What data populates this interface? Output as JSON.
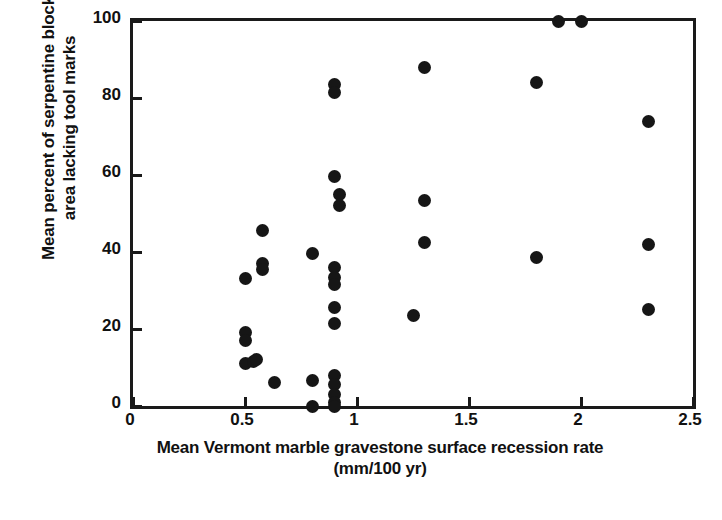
{
  "chart_data": {
    "type": "scatter",
    "title": "",
    "xlabel": "Mean Vermont marble gravestone surface recession rate (mm/100 yr)",
    "xlabel_line1": "Mean Vermont marble gravestone surface recession rate",
    "xlabel_line2": "(mm/100 yr)",
    "ylabel": "Mean percent of serpentine block area lacking tool marks",
    "ylabel_line1": "Mean percent of serpentine block",
    "ylabel_line2": "area lacking tool marks",
    "xlim": [
      0,
      2.5
    ],
    "ylim": [
      0,
      100
    ],
    "xticks": [
      0,
      0.5,
      1,
      1.5,
      2,
      2.5
    ],
    "xticklabels": [
      "0",
      "0.5",
      "1",
      "1.5",
      "2",
      "2.5"
    ],
    "yticks": [
      0,
      20,
      40,
      60,
      80,
      100
    ],
    "yticklabels": [
      "0",
      "20",
      "40",
      "60",
      "80",
      "100"
    ],
    "grid": false,
    "legend": "none",
    "marker": "filled-circle",
    "marker_color": "#161616",
    "frame_color": "#1a1a1a",
    "background": "#ffffff",
    "points": [
      {
        "x": 0.5,
        "y": 33.0
      },
      {
        "x": 0.5,
        "y": 19.0
      },
      {
        "x": 0.5,
        "y": 17.0
      },
      {
        "x": 0.5,
        "y": 11.0
      },
      {
        "x": 0.54,
        "y": 11.5
      },
      {
        "x": 0.55,
        "y": 12.0
      },
      {
        "x": 0.58,
        "y": 37.0
      },
      {
        "x": 0.58,
        "y": 35.5
      },
      {
        "x": 0.58,
        "y": 45.5
      },
      {
        "x": 0.63,
        "y": 6.0
      },
      {
        "x": 0.8,
        "y": 39.5
      },
      {
        "x": 0.8,
        "y": 6.5
      },
      {
        "x": 0.8,
        "y": 0.0
      },
      {
        "x": 0.9,
        "y": 83.5
      },
      {
        "x": 0.9,
        "y": 81.5
      },
      {
        "x": 0.9,
        "y": 59.5
      },
      {
        "x": 0.92,
        "y": 55.0
      },
      {
        "x": 0.92,
        "y": 52.0
      },
      {
        "x": 0.9,
        "y": 36.0
      },
      {
        "x": 0.9,
        "y": 33.5
      },
      {
        "x": 0.9,
        "y": 31.5
      },
      {
        "x": 0.9,
        "y": 25.5
      },
      {
        "x": 0.9,
        "y": 21.5
      },
      {
        "x": 0.9,
        "y": 8.0
      },
      {
        "x": 0.9,
        "y": 5.5
      },
      {
        "x": 0.9,
        "y": 3.0
      },
      {
        "x": 0.9,
        "y": 1.0
      },
      {
        "x": 0.9,
        "y": 0.0
      },
      {
        "x": 1.25,
        "y": 23.5
      },
      {
        "x": 1.3,
        "y": 88.0
      },
      {
        "x": 1.3,
        "y": 53.5
      },
      {
        "x": 1.3,
        "y": 42.5
      },
      {
        "x": 1.8,
        "y": 84.0
      },
      {
        "x": 1.8,
        "y": 38.5
      },
      {
        "x": 1.9,
        "y": 100.0
      },
      {
        "x": 2.0,
        "y": 100.0
      },
      {
        "x": 2.3,
        "y": 74.0
      },
      {
        "x": 2.3,
        "y": 42.0
      },
      {
        "x": 2.3,
        "y": 25.0
      }
    ]
  }
}
